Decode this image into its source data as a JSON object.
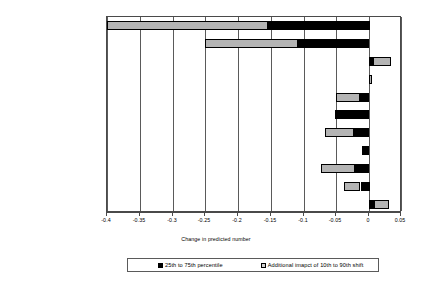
{
  "chart_data": {
    "type": "bar",
    "orientation": "horizontal",
    "title": "",
    "xlabel": "Change in predicted number",
    "ylabel": "",
    "xlim": [
      -0.4,
      0.05
    ],
    "xticks": [
      "-0.4",
      "-0.35",
      "-0.3",
      "-0.25",
      "-0.2",
      "-0.15",
      "-0.1",
      "-0.05",
      "0",
      "0.05"
    ],
    "xtick_values": [
      -0.4,
      -0.35,
      -0.3,
      -0.25,
      -0.2,
      -0.15,
      -0.1,
      -0.05,
      0,
      0.05
    ],
    "grid": "vertical",
    "legend_position": "bottom",
    "stacked": true,
    "categories": [
      "% President's party in Congress",
      "Presidential approval",
      "Support for war",
      "Δ Presidential approval",
      "Δ Support for war",
      "Election year",
      "Misery index",
      "Quarterly casualties",
      "Ln(cumulative casualties)",
      "Military progress",
      "Military setbacks"
    ],
    "series": [
      {
        "name": "25th to 75th percentile",
        "color": "#000000",
        "values": [
          -0.155,
          -0.108,
          0.006,
          0.0,
          -0.015,
          -0.052,
          -0.023,
          -0.011,
          -0.022,
          -0.013,
          0.008
        ]
      },
      {
        "name": "Additional imapct of 10th to 90th shift",
        "color": "#b4b4b4",
        "values": [
          -0.245,
          -0.142,
          0.028,
          0.004,
          -0.036,
          0.0,
          -0.045,
          0.0,
          -0.052,
          -0.025,
          0.023
        ]
      }
    ],
    "bars": [
      {
        "category": "% President's party in Congress",
        "black_from": -0.155,
        "black_to": 0.0,
        "gray_from": -0.4,
        "gray_to": -0.155
      },
      {
        "category": "Presidential approval",
        "black_from": -0.108,
        "black_to": 0.0,
        "gray_from": -0.25,
        "gray_to": -0.108
      },
      {
        "category": "Support for war",
        "black_from": 0.0,
        "black_to": 0.006,
        "gray_from": 0.006,
        "gray_to": 0.034
      },
      {
        "category": "Δ Presidential approval",
        "black_from": 0.0,
        "black_to": 0.0,
        "gray_from": 0.0,
        "gray_to": 0.004
      },
      {
        "category": "Δ Support for war",
        "black_from": -0.015,
        "black_to": 0.0,
        "gray_from": -0.051,
        "gray_to": -0.015
      },
      {
        "category": "Election year",
        "black_from": -0.052,
        "black_to": 0.0,
        "gray_from": 0.0,
        "gray_to": 0.0
      },
      {
        "category": "Misery index",
        "black_from": -0.023,
        "black_to": 0.0,
        "gray_from": -0.068,
        "gray_to": -0.023
      },
      {
        "category": "Quarterly casualties",
        "black_from": -0.011,
        "black_to": 0.0,
        "gray_from": 0.0,
        "gray_to": 0.0
      },
      {
        "category": "Ln(cumulative casualties)",
        "black_from": -0.022,
        "black_to": 0.0,
        "gray_from": -0.074,
        "gray_to": -0.022
      },
      {
        "category": "Military progress",
        "black_from": -0.013,
        "black_to": 0.0,
        "gray_from": -0.038,
        "gray_to": -0.013
      },
      {
        "category": "Military setbacks",
        "black_from": 0.0,
        "black_to": 0.008,
        "gray_from": 0.008,
        "gray_to": 0.031
      }
    ]
  },
  "legend": {
    "entries": [
      {
        "label": "25th to 75th percentile",
        "swatch": "black"
      },
      {
        "label": "Additional imapct of 10th to 90th shift",
        "swatch": "gray"
      }
    ]
  },
  "axis": {
    "xlabel": "Change in predicted number"
  }
}
